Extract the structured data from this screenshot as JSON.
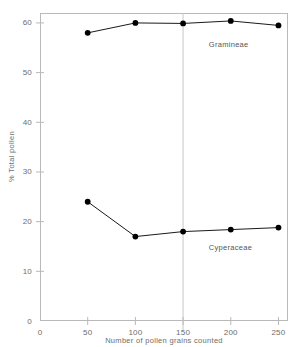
{
  "chart_data": {
    "type": "line",
    "title": "",
    "xlabel": "Number of pollen grains counted",
    "ylabel": "% Total pollen",
    "x": [
      50,
      100,
      150,
      200,
      250
    ],
    "xlim": [
      0,
      260
    ],
    "ylim": [
      0,
      62
    ],
    "xticks": [
      0,
      50,
      100,
      150,
      200,
      250
    ],
    "yticks": [
      0,
      10,
      20,
      30,
      40,
      50,
      60
    ],
    "xtick_labels": [
      "0",
      "50",
      "100",
      "150",
      "200",
      "250"
    ],
    "ytick_labels": [
      "0",
      "10",
      "20",
      "30",
      "40",
      "50",
      "60"
    ],
    "grid": false,
    "legend_position": "inline-annotation",
    "reference_line_x": 150,
    "series": [
      {
        "name": "Gramineae",
        "values": [
          58.0,
          60.0,
          59.9,
          60.4,
          59.5
        ],
        "color": "#000000",
        "label_x": 200,
        "label_y": 55.5
      },
      {
        "name": "Cyperaceae",
        "values": [
          24.0,
          17.0,
          18.0,
          18.4,
          18.8
        ],
        "color": "#000000",
        "label_x": 200,
        "label_y": 14.6
      }
    ],
    "colors": {
      "marker": "#000000",
      "line": "#1a1a1a",
      "axis": "#b9b9b9",
      "tick_text": "#6d6d6d",
      "reference_line": "#c8c8c8",
      "background": "#ffffff"
    }
  }
}
